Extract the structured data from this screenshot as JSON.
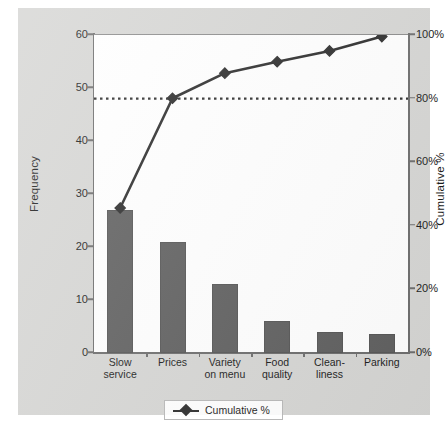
{
  "chart_data": {
    "type": "bar",
    "title": "",
    "subtitle": "",
    "categories": [
      "Slow service",
      "Prices",
      "Variety on menu",
      "Food quality",
      "Clean-liness",
      "Parking"
    ],
    "category_lines": [
      [
        "Slow",
        "service"
      ],
      [
        "Prices",
        ""
      ],
      [
        "Variety",
        "on menu"
      ],
      [
        "Food",
        "quality"
      ],
      [
        "Clean-",
        "liness"
      ],
      [
        "Parking",
        ""
      ]
    ],
    "values": [
      27,
      21,
      13,
      6,
      4,
      3.5
    ],
    "series": [
      {
        "name": "Frequency",
        "type": "bar",
        "values": [
          27,
          21,
          13,
          6,
          4,
          3.5
        ]
      },
      {
        "name": "Cumulative %",
        "type": "line",
        "values": [
          36.2,
          64.4,
          81.9,
          90.0,
          95.3,
          100.0
        ]
      }
    ],
    "cumulative_plotted_percent": [
      45.6,
      80.1,
      88.0,
      91.6,
      95.0,
      99.5
    ],
    "xlabel": "",
    "ylabel": "Frequency",
    "y2label": "Cumulative %",
    "ylim": [
      0,
      60
    ],
    "y2lim": [
      0,
      100
    ],
    "yticks": [
      0,
      10,
      20,
      30,
      40,
      50,
      60
    ],
    "ytick_labels": [
      "0",
      "10",
      "20",
      "30",
      "40",
      "50",
      "60"
    ],
    "y2ticks": [
      0,
      20,
      40,
      60,
      80,
      100
    ],
    "y2tick_labels": [
      "0%",
      "20%",
      "40%",
      "60%",
      "80%",
      "100%"
    ],
    "reference_line": {
      "value": 80,
      "axis": "y2",
      "style": "dotted",
      "label": ""
    },
    "grid": false,
    "legend": {
      "position": "bottom",
      "entries": [
        "Cumulative %"
      ]
    },
    "colors": {
      "bar": "#5f5f5f",
      "line": "#2b2b2b",
      "marker": "#2b2b2b",
      "background": "#d6d6d4",
      "panel": "#ffffff",
      "axis": "#6d6d6d",
      "text": "#1b1b1b"
    }
  },
  "legend": {
    "label": "Cumulative %"
  }
}
